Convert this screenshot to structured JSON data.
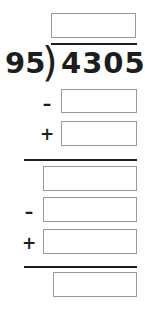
{
  "problem": {
    "type": "long-division",
    "divisor": "95",
    "dividend": "4305",
    "division_bracket": ")",
    "operators": {
      "minus": "–",
      "plus": "+"
    }
  },
  "answer_boxes": [
    {
      "name": "quotient-box",
      "value": "",
      "placeholder": ""
    },
    {
      "name": "partial-product-box-1",
      "value": "",
      "placeholder": ""
    },
    {
      "name": "bring-down-box-1",
      "value": "",
      "placeholder": ""
    },
    {
      "name": "remainder-box-1",
      "value": "",
      "placeholder": ""
    },
    {
      "name": "partial-product-box-2",
      "value": "",
      "placeholder": ""
    },
    {
      "name": "bring-down-box-2",
      "value": "",
      "placeholder": ""
    },
    {
      "name": "final-remainder-box",
      "value": "",
      "placeholder": ""
    }
  ],
  "operator_labels": [
    {
      "name": "minus-operator-1",
      "symbol": "–"
    },
    {
      "name": "plus-operator-1",
      "symbol": "+"
    },
    {
      "name": "minus-operator-2",
      "symbol": "–"
    },
    {
      "name": "plus-operator-2",
      "symbol": "+"
    }
  ],
  "colors": {
    "ink": "#1d1d1d",
    "box_border": "#9a9a9a",
    "background": "#ffffff"
  }
}
